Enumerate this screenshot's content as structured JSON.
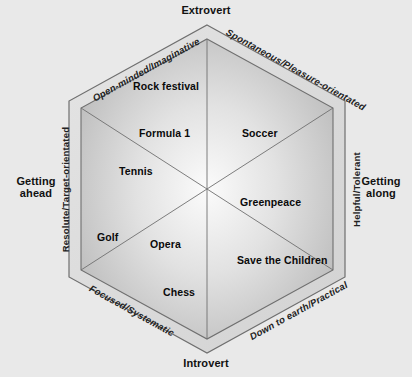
{
  "diagram": {
    "title_poles": {
      "top": "Extrovert",
      "bottom": "Introvert",
      "left": "Getting\nahead",
      "right": "Getting\nalong"
    },
    "edges": [
      {
        "id": "upper-left",
        "label": "Open-minded/Imaginative"
      },
      {
        "id": "upper-right",
        "label": "Spontaneous/Pleasure-orientated"
      },
      {
        "id": "right",
        "label": "Helpful/Tolerant"
      },
      {
        "id": "lower-right",
        "label": "Down to earth/Practical"
      },
      {
        "id": "lower-left",
        "label": "Focused/Systematic"
      },
      {
        "id": "left",
        "label": "Resolute/Target-orientated"
      }
    ],
    "items": [
      {
        "id": "rock-festival",
        "label": "Rock festival"
      },
      {
        "id": "formula-1",
        "label": "Formula 1"
      },
      {
        "id": "soccer",
        "label": "Soccer"
      },
      {
        "id": "tennis",
        "label": "Tennis"
      },
      {
        "id": "greenpeace",
        "label": "Greenpeace"
      },
      {
        "id": "golf",
        "label": "Golf"
      },
      {
        "id": "opera",
        "label": "Opera"
      },
      {
        "id": "save-the-children",
        "label": "Save the Children"
      },
      {
        "id": "chess",
        "label": "Chess"
      }
    ],
    "colors": {
      "background": "#e9e9e9",
      "fill_light": "#f4f4f4",
      "fill_dark": "#bdbdbd",
      "stroke": "#6f6f6f",
      "text": "#111111"
    }
  }
}
